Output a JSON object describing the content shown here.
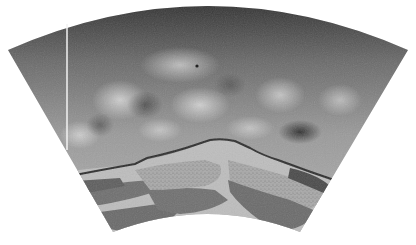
{
  "figure": {
    "shape": "annular-wedge",
    "colors": {
      "background": "#ffffff",
      "mantle_dark": "#3a3a3a",
      "mantle_mid": "#8c8c8c",
      "mantle_light": "#d8d8d8",
      "core_boundary_line": "#2e2e2e",
      "slab_dark": "#6e6e6e",
      "slab_speckle": "#a9a9a9",
      "lower_layer": "#c4c4c4",
      "vertical_line": "#f2f2f2"
    }
  }
}
